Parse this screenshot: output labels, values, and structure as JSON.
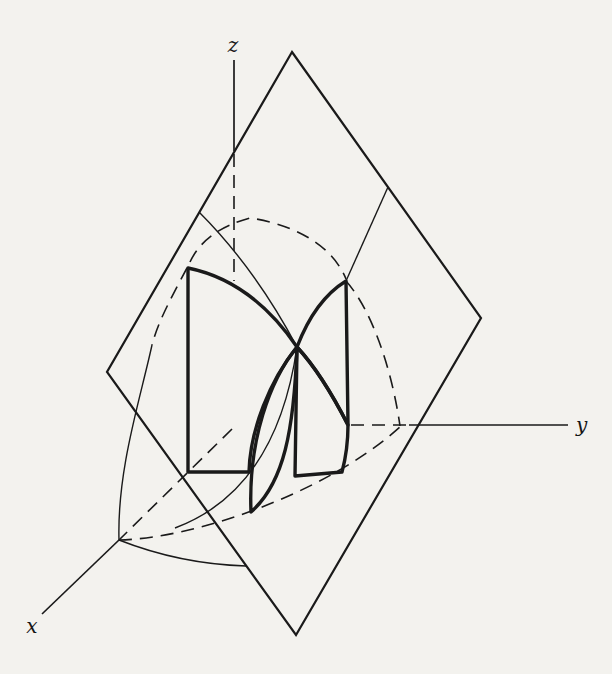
{
  "figure": {
    "axis_labels": {
      "x": "x",
      "y": "y",
      "z": "z"
    },
    "colors": {
      "background": "#f3f2ee",
      "ink": "#1a1a1a",
      "petal_light": "#c8c6c2",
      "petal_dark": "#9a9893"
    },
    "paths": {
      "plane_outline": "M292,52 L481,318 L296,635 L107,372 Z",
      "petal_upper_left": "M188,268 Q252,281 297,347 C270,380 250,430 249,472 L188,472 Z",
      "petal_lower_mid": "M297,347 C270,380 248,440 251,512 C284,483 294,430 297,347 Z",
      "petal_lower_right": "M297,347 L295,476 L342,472 C346,457 348,440 348,425 Q322,374 297,347 Z",
      "petal_upper_right": "M297,347 Q315,300 346,281 L348,425 Q322,374 297,347 Z",
      "z_axis_solid": "M234,60 L234,151",
      "z_axis_dash": "M234,154 L234,281",
      "y_axis_dash": "M351,425 L409,425",
      "y_axis_solid": "M409,425 L568,425",
      "x_axis_dash": "M232,429 L119,540",
      "x_axis_solid": "M119,540 L42,614",
      "chord_left": "M199,212 Q255,268 297,347",
      "chord_right": "M388,187 L346,281",
      "curve_center_to_floor": "M297,347 C285,430 250,500 175,528",
      "arc_left_hidden": "M187,268 C170,300 158,322 152,345",
      "arc_left_visible": "M152,345 C140,400 117,470 119,540",
      "floor_front_arc": "M119,540 Q180,564 246,566",
      "circle_top_dash": "M190,262 Q205,230 250,218 C285,223 330,240 346,279",
      "circle_right_dash": "M346,281 C372,310 392,370 400,426",
      "floor_circle_dash": "M119,540 C200,538 330,490 400,427"
    }
  }
}
